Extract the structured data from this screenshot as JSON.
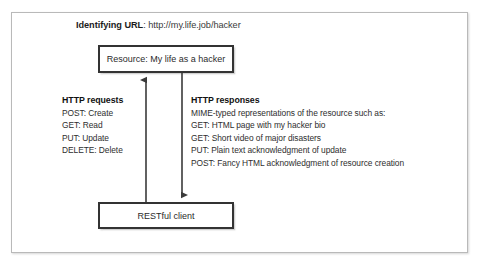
{
  "figure": {
    "title_label": "Identifying URL",
    "title_separator": ": ",
    "title_url": "http://my.life.job/hacker"
  },
  "nodes": {
    "resource": "Resource: My life as a hacker",
    "client": "RESTful client"
  },
  "requests": {
    "heading": "HTTP requests",
    "lines": [
      "POST: Create",
      "GET: Read",
      "PUT: Update",
      "DELETE: Delete"
    ]
  },
  "responses": {
    "heading": "HTTP responses",
    "lines": [
      "MIME-typed representations of the resource such as:",
      "GET: HTML page with my hacker bio",
      "GET: Short video of major disasters",
      "PUT: Plain text acknowledgment of update",
      "POST: Fancy HTML acknowledgment of resource creation"
    ]
  },
  "connectors": {
    "request_arrow": "arrow-up-request",
    "response_arrow": "arrow-down-response"
  },
  "colors": {
    "box_border": "#333333",
    "frame_border": "#b9b9b9",
    "text": "#2e2e2e",
    "arrow": "#3a3a3a"
  }
}
